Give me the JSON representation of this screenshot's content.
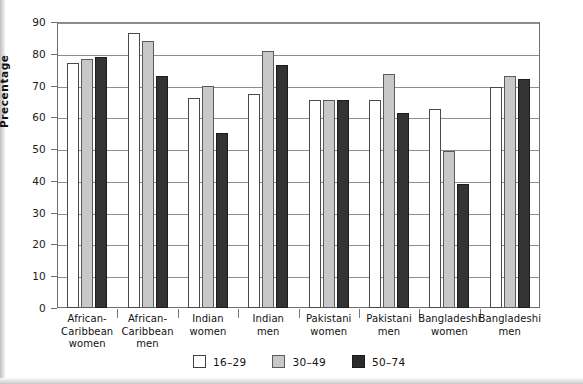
{
  "chart_data": {
    "type": "bar",
    "title": "",
    "xlabel": "",
    "ylabel": "Precentage",
    "ylim": [
      0,
      90
    ],
    "yticks": [
      0,
      10,
      20,
      30,
      40,
      50,
      60,
      70,
      80,
      90
    ],
    "grid": true,
    "legend_position": "bottom",
    "categories": [
      "African-\nCaribbean\nwomen",
      "African-\nCaribbean\nmen",
      "Indian\nwomen",
      "Indian\nmen",
      "Pakistani\nwomen",
      "Pakistani\nmen",
      "Bangladeshi\nwomen",
      "Bangladeshi\nmen"
    ],
    "series": [
      {
        "name": "16–29",
        "color": "#ffffff",
        "values": [
          77.0,
          86.5,
          66.0,
          67.5,
          65.5,
          65.5,
          62.5,
          69.5
        ]
      },
      {
        "name": "30–49",
        "color": "#c8c8c8",
        "values": [
          78.5,
          84.0,
          70.0,
          81.0,
          65.5,
          73.5,
          49.5,
          73.0
        ]
      },
      {
        "name": "50–74",
        "color": "#333333",
        "values": [
          79.0,
          73.0,
          55.0,
          76.5,
          65.5,
          61.5,
          39.0,
          72.0
        ]
      }
    ]
  },
  "axis": {
    "y_title": "Precentage",
    "y_tick_labels": [
      "90",
      "80",
      "70",
      "60",
      "50",
      "40",
      "30",
      "20",
      "10",
      "0"
    ]
  },
  "legend": {
    "items": [
      {
        "label": "16–29",
        "swatch": "white-square-swatch"
      },
      {
        "label": "30–49",
        "swatch": "gray-square-swatch"
      },
      {
        "label": "50–74",
        "swatch": "black-square-swatch"
      }
    ]
  },
  "categories_display": [
    [
      "African-",
      "Caribbean",
      "women"
    ],
    [
      "African-",
      "Caribbean",
      "men"
    ],
    [
      "Indian",
      "women"
    ],
    [
      "Indian",
      "men"
    ],
    [
      "Pakistani",
      "women"
    ],
    [
      "Pakistani",
      "men"
    ],
    [
      "Bangladeshi",
      "women"
    ],
    [
      "Bangladeshi",
      "men"
    ]
  ]
}
